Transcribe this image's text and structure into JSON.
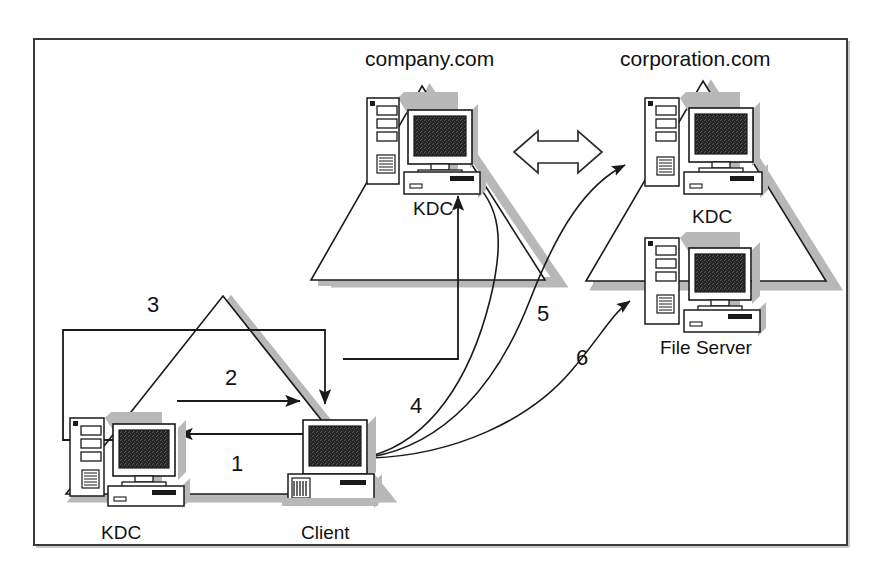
{
  "figure": {
    "type": "network-diagram",
    "frame": {
      "border_color": "#333333",
      "background": "#ffffff"
    },
    "colors": {
      "line": "#1a1a1a",
      "shadow": "#b3b3b3",
      "screen": "#262626",
      "case": "#ffffff",
      "text": "#111111"
    }
  },
  "realms": [
    {
      "id": "company",
      "label": "company.com",
      "label_pos": {
        "x": 365,
        "y": 58
      },
      "apex": {
        "x": 422,
        "y": 86
      },
      "base_left": {
        "x": 311,
        "y": 280
      },
      "base_right": {
        "x": 545,
        "y": 280
      },
      "nodes": [
        {
          "id": "company-kdc",
          "label": "KDC",
          "label_pos": {
            "x": 413,
            "y": 199
          }
        }
      ]
    },
    {
      "id": "corporation",
      "label": "corporation.com",
      "label_pos": {
        "x": 620,
        "y": 58
      },
      "apex": {
        "x": 703,
        "y": 81
      },
      "base_left": {
        "x": 586,
        "y": 281
      },
      "base_right": {
        "x": 826,
        "y": 281
      },
      "nodes": [
        {
          "id": "corporation-kdc",
          "label": "KDC",
          "label_pos": {
            "x": 692,
            "y": 207
          }
        },
        {
          "id": "file-server",
          "label": "File Server",
          "label_pos": {
            "x": 660,
            "y": 338
          }
        }
      ]
    },
    {
      "id": "local",
      "label": "",
      "label_pos": {
        "x": 0,
        "y": 0
      },
      "apex": {
        "x": 223,
        "y": 296
      },
      "base_left": {
        "x": 66,
        "y": 494
      },
      "base_right": {
        "x": 380,
        "y": 494
      },
      "nodes": [
        {
          "id": "local-kdc",
          "label": "KDC",
          "label_pos": {
            "x": 101,
            "y": 523
          }
        },
        {
          "id": "client",
          "label": "Client",
          "label_pos": {
            "x": 301,
            "y": 523
          }
        }
      ]
    }
  ],
  "steps": [
    {
      "n": "1",
      "label_pos": {
        "x": 231,
        "y": 453
      },
      "desc": "KDC reply to client"
    },
    {
      "n": "2",
      "label_pos": {
        "x": 225,
        "y": 367
      },
      "desc": "Client request to KDC"
    },
    {
      "n": "3",
      "label_pos": {
        "x": 147,
        "y": 294
      },
      "desc": "Referral routed to company.com KDC"
    },
    {
      "n": "4",
      "label_pos": {
        "x": 410,
        "y": 395
      },
      "desc": "Client to company.com KDC"
    },
    {
      "n": "5",
      "label_pos": {
        "x": 537,
        "y": 303
      },
      "desc": "Client to corporation.com KDC"
    },
    {
      "n": "6",
      "label_pos": {
        "x": 576,
        "y": 347
      },
      "desc": "Client to File Server"
    }
  ],
  "connectors": [
    {
      "id": "trust-arrow",
      "kind": "double-headed-arrow",
      "from": "company.com",
      "to": "corporation.com"
    },
    {
      "id": "step1-arrow",
      "kind": "straight-arrow",
      "direction": "right-to-left"
    },
    {
      "id": "step2-arrow",
      "kind": "straight-arrow",
      "direction": "left-to-right"
    },
    {
      "id": "step3-path",
      "kind": "orthogonal-arrow",
      "direction": "kdc-to-client"
    },
    {
      "id": "step3b-path",
      "kind": "orthogonal-arrow",
      "direction": "up-to-company-kdc"
    },
    {
      "id": "step4-curve",
      "kind": "curved-arrow",
      "target": "company-kdc"
    },
    {
      "id": "step5-curve",
      "kind": "curved-arrow",
      "target": "corporation-kdc"
    },
    {
      "id": "step6-curve",
      "kind": "curved-arrow",
      "target": "file-server"
    }
  ]
}
